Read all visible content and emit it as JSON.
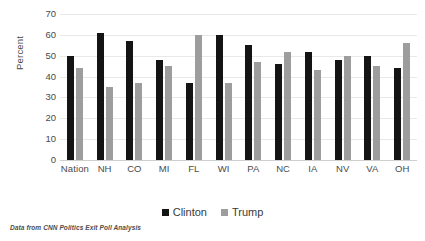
{
  "chart_data": {
    "type": "bar",
    "title": "",
    "subtitle": "",
    "xlabel": "",
    "ylabel": "Percent",
    "ylim": [
      0,
      70
    ],
    "ytick_step": 10,
    "yticks": [
      70,
      60,
      50,
      40,
      30,
      20,
      10,
      0
    ],
    "grid": true,
    "legend_position": "bottom-center",
    "categories": [
      "Nation",
      "NH",
      "CO",
      "MI",
      "FL",
      "WI",
      "PA",
      "NC",
      "IA",
      "NV",
      "VA",
      "OH"
    ],
    "series": [
      {
        "name": "Clinton",
        "color": "#141414",
        "values": [
          50,
          61,
          57,
          48,
          37,
          60,
          55,
          46,
          52,
          48,
          50,
          44
        ]
      },
      {
        "name": "Trump",
        "color": "#9d9d9d",
        "values": [
          44,
          35,
          37,
          45,
          60,
          37,
          47,
          52,
          43,
          50,
          45,
          56
        ]
      }
    ],
    "annotations": [
      "Data from CNN Politics Exit Poll Analysis"
    ]
  },
  "caption": {
    "text": "Data from CNN Politics Exit Poll Analysis"
  },
  "legend": {
    "items": [
      {
        "label": "Clinton",
        "swatch_color": "#141414"
      },
      {
        "label": "Trump",
        "swatch_color": "#9d9d9d"
      }
    ]
  },
  "axes": {
    "y_title": "Percent"
  }
}
